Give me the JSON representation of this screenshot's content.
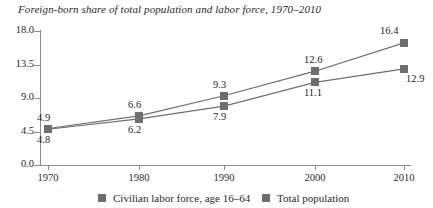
{
  "chart_data": {
    "type": "line",
    "title": "Foreign-born share of total population and labor force, 1970–2010",
    "xlabel": "",
    "ylabel": "",
    "x": [
      1970,
      1980,
      1990,
      2000,
      2010
    ],
    "categories": [
      "1970",
      "1980",
      "1990",
      "2000",
      "2010"
    ],
    "xtick_labels": [
      "1970",
      "1980",
      "1990",
      "2000",
      "2010"
    ],
    "ytick_labels": [
      "18.0",
      "13.5",
      "9.0",
      "4.5",
      "0.0"
    ],
    "yticks": [
      18.0,
      13.5,
      9.0,
      4.5,
      0.0
    ],
    "ylim": [
      0.0,
      18.0
    ],
    "xlim": [
      1966,
      2014
    ],
    "grid": false,
    "legend_position": "bottom",
    "marker": "square",
    "series": [
      {
        "name": "Civilian labor force, age 16–64",
        "color": "#6e6e6e",
        "values": [
          4.9,
          6.6,
          9.3,
          12.6,
          16.4
        ],
        "labels": [
          "4.9",
          "6.6",
          "9.3",
          "12.6",
          "16.4"
        ],
        "label_position": "above"
      },
      {
        "name": "Total population",
        "color": "#6e6e6e",
        "values": [
          4.8,
          6.2,
          7.9,
          11.1,
          12.9
        ],
        "labels": [
          "4.8",
          "6.2",
          "7.9",
          "11.1",
          "12.9"
        ],
        "label_position": "below"
      }
    ],
    "legend": [
      {
        "label": "Civilian labor force, age 16–64",
        "color": "#6e6e6e"
      },
      {
        "label": "Total population",
        "color": "#6e6e6e"
      }
    ]
  }
}
